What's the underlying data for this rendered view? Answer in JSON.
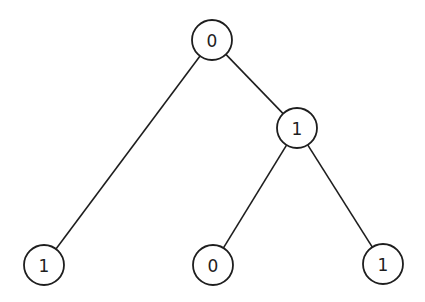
{
  "diagram": {
    "type": "binary-tree",
    "node_radius": 20,
    "colors": {
      "stroke": "#1e1e1e",
      "fill": "#ffffff",
      "background": "#ffffff"
    },
    "nodes": [
      {
        "id": "root",
        "label": "0",
        "x": 212,
        "y": 40
      },
      {
        "id": "right-child",
        "label": "1",
        "x": 297,
        "y": 128
      },
      {
        "id": "left-leaf",
        "label": "1",
        "x": 44,
        "y": 265
      },
      {
        "id": "mid-leaf",
        "label": "0",
        "x": 213,
        "y": 265
      },
      {
        "id": "right-leaf",
        "label": "1",
        "x": 383,
        "y": 264
      }
    ],
    "edges": [
      {
        "from": "root",
        "to": "left-leaf"
      },
      {
        "from": "root",
        "to": "right-child"
      },
      {
        "from": "right-child",
        "to": "mid-leaf"
      },
      {
        "from": "right-child",
        "to": "right-leaf"
      }
    ]
  }
}
